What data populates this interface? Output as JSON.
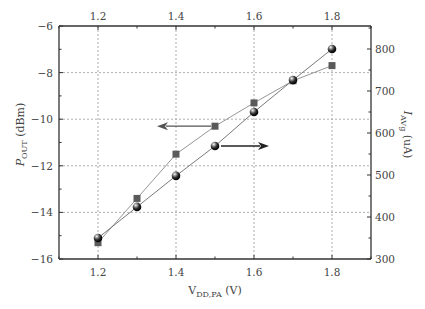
{
  "chart_data": {
    "type": "line",
    "title": "",
    "xlabel": "V_DD,PA (V)",
    "xlabel_main": "V",
    "xlabel_sub": "DD,PA",
    "xlabel_unit": " (V)",
    "ylabel_left": "P_OUT (dBm)",
    "ylabel_left_main": "P",
    "ylabel_left_sub": "OUT",
    "ylabel_left_unit": " (dBm)",
    "ylabel_right": "I_AVg (uA)",
    "ylabel_right_main": "I",
    "ylabel_right_sub": "AVg",
    "ylabel_right_unit": " (uA)",
    "xlim": [
      1.1,
      1.9
    ],
    "ylim_left": [
      -16,
      -6
    ],
    "ylim_right": [
      300,
      850
    ],
    "x_ticks": [
      1.2,
      1.4,
      1.6,
      1.8
    ],
    "x_tick_labels": [
      "1.2",
      "1.4",
      "1.6",
      "1.8"
    ],
    "y_left_ticks": [
      -16,
      -14,
      -12,
      -10,
      -8,
      -6
    ],
    "y_left_tick_labels": [
      "−16",
      "−14",
      "−12",
      "−10",
      "−8",
      "−6"
    ],
    "y_right_ticks": [
      300,
      400,
      500,
      600,
      700,
      800
    ],
    "y_right_tick_labels": [
      "300",
      "400",
      "500",
      "600",
      "700",
      "800"
    ],
    "grid": true,
    "x": [
      1.2,
      1.3,
      1.4,
      1.5,
      1.6,
      1.7,
      1.8
    ],
    "series": [
      {
        "name": "P_OUT",
        "axis": "left",
        "marker": "square",
        "color": "#5a5a5a",
        "values": [
          -15.3,
          -13.4,
          -11.5,
          -10.3,
          -9.3,
          -8.35,
          -7.7
        ]
      },
      {
        "name": "I_AVg",
        "axis": "right",
        "marker": "sphere",
        "color": "#1a1a1a",
        "values": [
          350,
          424,
          498,
          569,
          650,
          726,
          800
        ]
      }
    ],
    "annotations": [
      {
        "type": "arrow",
        "direction": "left",
        "points_to": "left axis",
        "series": "P_OUT",
        "from_x": 1.5
      },
      {
        "type": "arrow",
        "direction": "right",
        "points_to": "right axis",
        "series": "I_AVg",
        "from_x": 1.5
      }
    ],
    "legend": "none"
  }
}
